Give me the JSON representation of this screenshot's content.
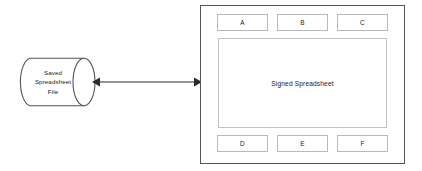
{
  "diagram": {
    "type": "flow-diagram",
    "background_color": "#ffffff",
    "stroke_color": "#54545a",
    "light_stroke_color": "#b9b9bd",
    "text_color": "#1a1a1a",
    "storage_node": {
      "shape": "cylinder",
      "label": "Saved\nSpreadsheet\nFile"
    },
    "connector": {
      "shape": "double-headed-arrow",
      "direction": "bidirectional",
      "label": ""
    },
    "device_panel": {
      "top_keys": [
        {
          "label": "A"
        },
        {
          "label": "B"
        },
        {
          "label": "C"
        }
      ],
      "screen": {
        "label": "Signed Spreadsheet"
      },
      "bottom_keys": [
        {
          "label": "D"
        },
        {
          "label": "E"
        },
        {
          "label": "F"
        }
      ]
    }
  }
}
